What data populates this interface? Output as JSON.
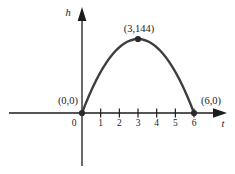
{
  "figure": {
    "background_color": "#ffffff",
    "axis_color": "#1c1c1c",
    "curve_color": "#3d3d3d",
    "point_color": "#2a2a2a",
    "text_color": "#1c1c1c"
  },
  "chart_data": {
    "type": "line",
    "title": "",
    "xlabel": "t",
    "ylabel": "h",
    "x_ticks": [
      0,
      1,
      2,
      3,
      4,
      5,
      6
    ],
    "x_tick_labels": [
      "0",
      "1",
      "2",
      "3",
      "4",
      "5",
      "6"
    ],
    "xlim": [
      -3.9,
      7.8
    ],
    "ylim": [
      -105,
      210
    ],
    "grid": false,
    "legend": null,
    "series": [
      {
        "name": "parabolic arc",
        "shape": "downward parabola with vertex (3,144), zeros at t=0 and t=6",
        "x": [
          0,
          1,
          2,
          3,
          4,
          5,
          6
        ],
        "y": [
          0,
          80,
          128,
          144,
          128,
          80,
          0
        ]
      }
    ],
    "marked_points": [
      {
        "t": 0,
        "h": 0,
        "label": "(0,0)"
      },
      {
        "t": 3,
        "h": 144,
        "label": "(3,144)"
      },
      {
        "t": 6,
        "h": 0,
        "label": "(6,0)"
      }
    ]
  }
}
